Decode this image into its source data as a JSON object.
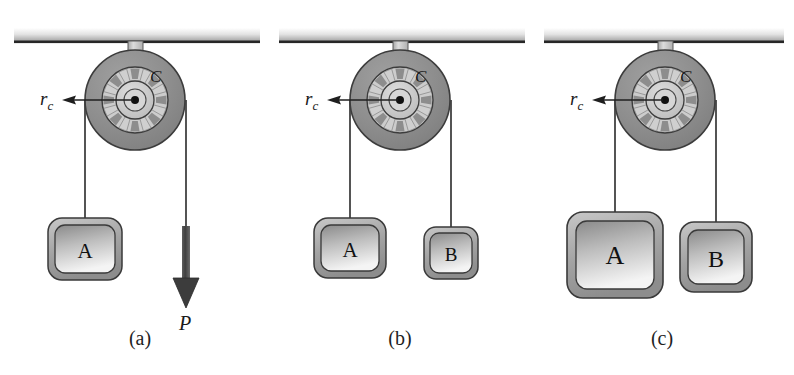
{
  "figure": {
    "type": "physics-diagram",
    "background_color": "#ffffff",
    "width": 794,
    "height": 375
  },
  "colors": {
    "rim_dark": "#8c8c8c",
    "rim_stroke": "#3a3a3a",
    "hub_light": "#c9c9c9",
    "spoke_gap_dark": "#8a8a8a",
    "axle_light": "#c5c5c5",
    "ceiling_top": "#ffffff",
    "ceiling_bottom": "#9a9a9a",
    "ceiling_edge": "#2b2b2b",
    "block_frame": "#a8a8a8",
    "block_face_top": "#8f8f8f",
    "block_face_bottom": "#f2f2f2",
    "rope": "#2a2a2a",
    "arrow_dark": "#4a4a4a",
    "text": "#1a1a1a"
  },
  "panels": [
    {
      "id": "panel-a",
      "caption": "(a)",
      "caption_x": 140,
      "caption_y": 345,
      "center_x": 135,
      "radius_label": "r",
      "radius_subscript": "c",
      "pulley_label": "C",
      "left_load": {
        "label": "A",
        "width": 74,
        "height": 62,
        "center_x": 85,
        "top_y": 218
      },
      "right_item": {
        "kind": "force-arrow",
        "label": "P",
        "center_x": 186,
        "label_y": 312
      }
    },
    {
      "id": "panel-b",
      "caption": "(b)",
      "caption_x": 400,
      "caption_y": 345,
      "center_x": 400,
      "radius_label": "r",
      "radius_subscript": "c",
      "pulley_label": "C",
      "left_load": {
        "label": "A",
        "width": 72,
        "height": 60,
        "center_x": 350,
        "top_y": 218
      },
      "right_item": {
        "kind": "block",
        "label": "B",
        "width": 54,
        "height": 52,
        "center_x": 451,
        "top_y": 227
      }
    },
    {
      "id": "panel-c",
      "caption": "(c)",
      "caption_x": 662,
      "caption_y": 345,
      "center_x": 665,
      "radius_label": "r",
      "radius_subscript": "c",
      "pulley_label": "C",
      "left_load": {
        "label": "A",
        "width": 96,
        "height": 86,
        "center_x": 615,
        "top_y": 212
      },
      "right_item": {
        "kind": "block",
        "label": "B",
        "width": 72,
        "height": 70,
        "center_x": 716,
        "top_y": 222
      }
    }
  ],
  "pulley": {
    "outer_radius": 50,
    "rim_inner_radius": 38,
    "spoke_ring_outer_radius": 33,
    "spoke_ring_inner_radius": 19,
    "hub_radius": 12,
    "center_dot_radius": 4,
    "spoke_count": 8,
    "center_y": 100,
    "ceiling_y": 38
  },
  "annotations": {
    "radius_arrow_note": "r_c points from the pulley centre to the inner spoke-ring radius",
    "force_arrow_note": "P is the downward applied force on the cord in panel (a)"
  }
}
